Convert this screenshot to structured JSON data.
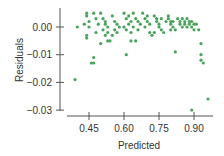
{
  "chart_data": {
    "type": "scatter",
    "title": "",
    "xlabel": "Predicted",
    "ylabel": "Residuals",
    "xlim": [
      0.36,
      0.97
    ],
    "ylim": [
      -0.031,
      0.007
    ],
    "grid": false,
    "legend": null,
    "x_ticks": [
      0.45,
      0.6,
      0.75,
      0.9
    ],
    "x_tick_labels": [
      "0.45",
      "0.60",
      "0.75",
      "0.90"
    ],
    "y_ticks": [
      0.0,
      -0.01,
      -0.02,
      -0.03
    ],
    "y_tick_labels": [
      "0.00",
      "-0.01",
      "-0.02",
      "-0.03"
    ],
    "point_color": "#4aa35a",
    "series": [
      {
        "name": "residuals",
        "points": [
          [
            0.4,
            0.0
          ],
          [
            0.39,
            -0.019
          ],
          [
            0.44,
            0.005
          ],
          [
            0.44,
            0.004
          ],
          [
            0.45,
            0.002
          ],
          [
            0.43,
            0.001
          ],
          [
            0.45,
            0.0
          ],
          [
            0.44,
            -0.003
          ],
          [
            0.44,
            -0.004
          ],
          [
            0.47,
            0.005
          ],
          [
            0.48,
            0.003
          ],
          [
            0.49,
            0.001
          ],
          [
            0.48,
            -0.002
          ],
          [
            0.47,
            -0.011
          ],
          [
            0.46,
            -0.013
          ],
          [
            0.47,
            -0.013
          ],
          [
            0.5,
            0.005
          ],
          [
            0.51,
            0.003
          ],
          [
            0.52,
            0.002
          ],
          [
            0.52,
            0.001
          ],
          [
            0.51,
            -0.001
          ],
          [
            0.53,
            0.0
          ],
          [
            0.53,
            -0.002
          ],
          [
            0.52,
            -0.003
          ],
          [
            0.5,
            -0.006
          ],
          [
            0.53,
            -0.005
          ],
          [
            0.54,
            -0.005
          ],
          [
            0.55,
            0.004
          ],
          [
            0.56,
            0.002
          ],
          [
            0.57,
            0.001
          ],
          [
            0.56,
            -0.001
          ],
          [
            0.55,
            -0.003
          ],
          [
            0.58,
            0.0
          ],
          [
            0.57,
            -0.002
          ],
          [
            0.6,
            0.005
          ],
          [
            0.61,
            0.003
          ],
          [
            0.62,
            0.004
          ],
          [
            0.62,
            0.001
          ],
          [
            0.6,
            0.0
          ],
          [
            0.61,
            -0.001
          ],
          [
            0.63,
            0.002
          ],
          [
            0.63,
            -0.002
          ],
          [
            0.64,
            0.005
          ],
          [
            0.65,
            0.003
          ],
          [
            0.66,
            0.002
          ],
          [
            0.64,
            0.0
          ],
          [
            0.66,
            -0.001
          ],
          [
            0.67,
            0.001
          ],
          [
            0.63,
            -0.005
          ],
          [
            0.65,
            -0.005
          ],
          [
            0.61,
            -0.01
          ],
          [
            0.68,
            0.005
          ],
          [
            0.69,
            0.003
          ],
          [
            0.7,
            0.004
          ],
          [
            0.7,
            0.002
          ],
          [
            0.71,
            0.001
          ],
          [
            0.69,
            0.0
          ],
          [
            0.71,
            -0.002
          ],
          [
            0.72,
            -0.003
          ],
          [
            0.73,
            0.004
          ],
          [
            0.74,
            0.003
          ],
          [
            0.74,
            0.002
          ],
          [
            0.75,
            0.001
          ],
          [
            0.76,
            0.003
          ],
          [
            0.75,
            0.0
          ],
          [
            0.76,
            -0.001
          ],
          [
            0.73,
            -0.002
          ],
          [
            0.77,
            -0.002
          ],
          [
            0.78,
            0.002
          ],
          [
            0.79,
            0.004
          ],
          [
            0.79,
            0.003
          ],
          [
            0.8,
            0.002
          ],
          [
            0.8,
            0.001
          ],
          [
            0.81,
            0.002
          ],
          [
            0.81,
            0.0
          ],
          [
            0.8,
            -0.001
          ],
          [
            0.82,
            -0.001
          ],
          [
            0.82,
            -0.009
          ],
          [
            0.83,
            0.003
          ],
          [
            0.84,
            0.002
          ],
          [
            0.84,
            0.001
          ],
          [
            0.85,
            0.003
          ],
          [
            0.85,
            0.0
          ],
          [
            0.86,
            0.002
          ],
          [
            0.86,
            0.001
          ],
          [
            0.87,
            0.003
          ],
          [
            0.87,
            0.0
          ],
          [
            0.88,
            0.002
          ],
          [
            0.88,
            0.001
          ],
          [
            0.89,
            0.002
          ],
          [
            0.89,
            0.0
          ],
          [
            0.9,
            0.001
          ],
          [
            0.9,
            -0.001
          ],
          [
            0.91,
            0.001
          ],
          [
            0.92,
            -0.001
          ],
          [
            0.93,
            -0.006
          ],
          [
            0.93,
            -0.01
          ],
          [
            0.93,
            -0.012
          ],
          [
            0.94,
            -0.013
          ],
          [
            0.89,
            -0.03
          ],
          [
            0.96,
            -0.026
          ]
        ]
      }
    ]
  }
}
